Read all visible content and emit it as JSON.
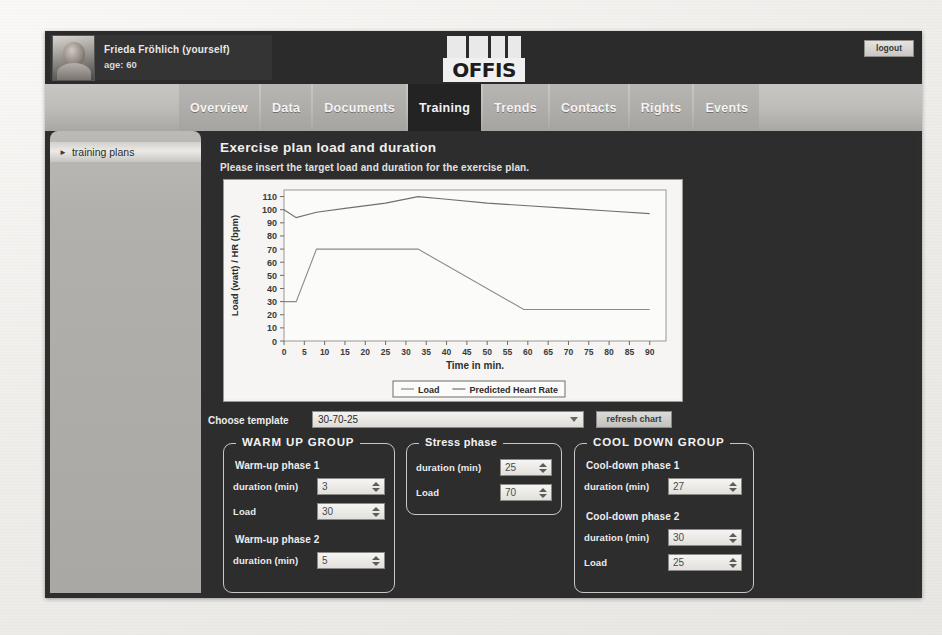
{
  "header": {
    "user_name": "Frieda Fröhlich (yourself)",
    "user_age": "age: 60",
    "logo_text": "OFFIS",
    "logout_label": "logout"
  },
  "tabs": [
    {
      "label": "Overview",
      "active": false
    },
    {
      "label": "Data",
      "active": false
    },
    {
      "label": "Documents",
      "active": false
    },
    {
      "label": "Training",
      "active": true
    },
    {
      "label": "Trends",
      "active": false
    },
    {
      "label": "Contacts",
      "active": false
    },
    {
      "label": "Rights",
      "active": false
    },
    {
      "label": "Events",
      "active": false
    }
  ],
  "sidebar": {
    "items": [
      {
        "label": "training plans",
        "icon": "triangle-right-icon"
      }
    ]
  },
  "panel": {
    "title": "Exercise plan load and duration",
    "subtitle": "Please insert the target load and duration for the exercise plan."
  },
  "template_row": {
    "label": "Choose template",
    "selected": "30-70-25",
    "refresh_label": "refresh chart"
  },
  "warm_up_group": {
    "legend": "WARM UP GROUP",
    "phase1_title": "Warm-up phase 1",
    "phase1_duration_label": "duration (min)",
    "phase1_duration_value": "3",
    "phase1_load_label": "Load",
    "phase1_load_value": "30",
    "phase2_title": "Warm-up phase 2",
    "phase2_duration_label": "duration (min)",
    "phase2_duration_value": "5"
  },
  "stress_phase": {
    "legend": "Stress phase",
    "duration_label": "duration (min)",
    "duration_value": "25",
    "load_label": "Load",
    "load_value": "70"
  },
  "cool_down_group": {
    "legend": "COOL DOWN GROUP",
    "phase1_title": "Cool-down phase 1",
    "phase1_duration_label": "duration (min)",
    "phase1_duration_value": "27",
    "phase2_title": "Cool-down phase 2",
    "phase2_duration_label": "duration (min)",
    "phase2_duration_value": "30",
    "phase2_load_label": "Load",
    "phase2_load_value": "25"
  },
  "colors": {
    "app_background": "#2d2d2d",
    "tab_active": "#232323",
    "chart_background": "#f3f2f0",
    "load_line": "#8a8a8a",
    "hr_line": "#6f6f6f"
  },
  "chart_data": {
    "type": "line",
    "title": "",
    "xlabel": "Time in min.",
    "ylabel": "Load (watt) / HR (bpm)",
    "xlim": [
      0,
      94
    ],
    "ylim": [
      0,
      115
    ],
    "xticks": [
      0,
      5,
      10,
      15,
      20,
      25,
      30,
      35,
      40,
      45,
      50,
      55,
      60,
      65,
      70,
      75,
      80,
      85,
      90
    ],
    "yticks": [
      0,
      10,
      20,
      30,
      40,
      50,
      60,
      70,
      80,
      90,
      100,
      110
    ],
    "grid": false,
    "legend_position": "bottom",
    "series": [
      {
        "name": "Load",
        "x": [
          0,
          3,
          8,
          33,
          59,
          90
        ],
        "y": [
          30,
          30,
          70,
          70,
          24,
          24
        ]
      },
      {
        "name": "Predicted Heart Rate",
        "x": [
          0,
          3,
          8,
          15,
          25,
          33,
          40,
          50,
          60,
          70,
          80,
          90
        ],
        "y": [
          100,
          94,
          98,
          101,
          105,
          110,
          108,
          105,
          103,
          101,
          99,
          97
        ]
      }
    ]
  }
}
